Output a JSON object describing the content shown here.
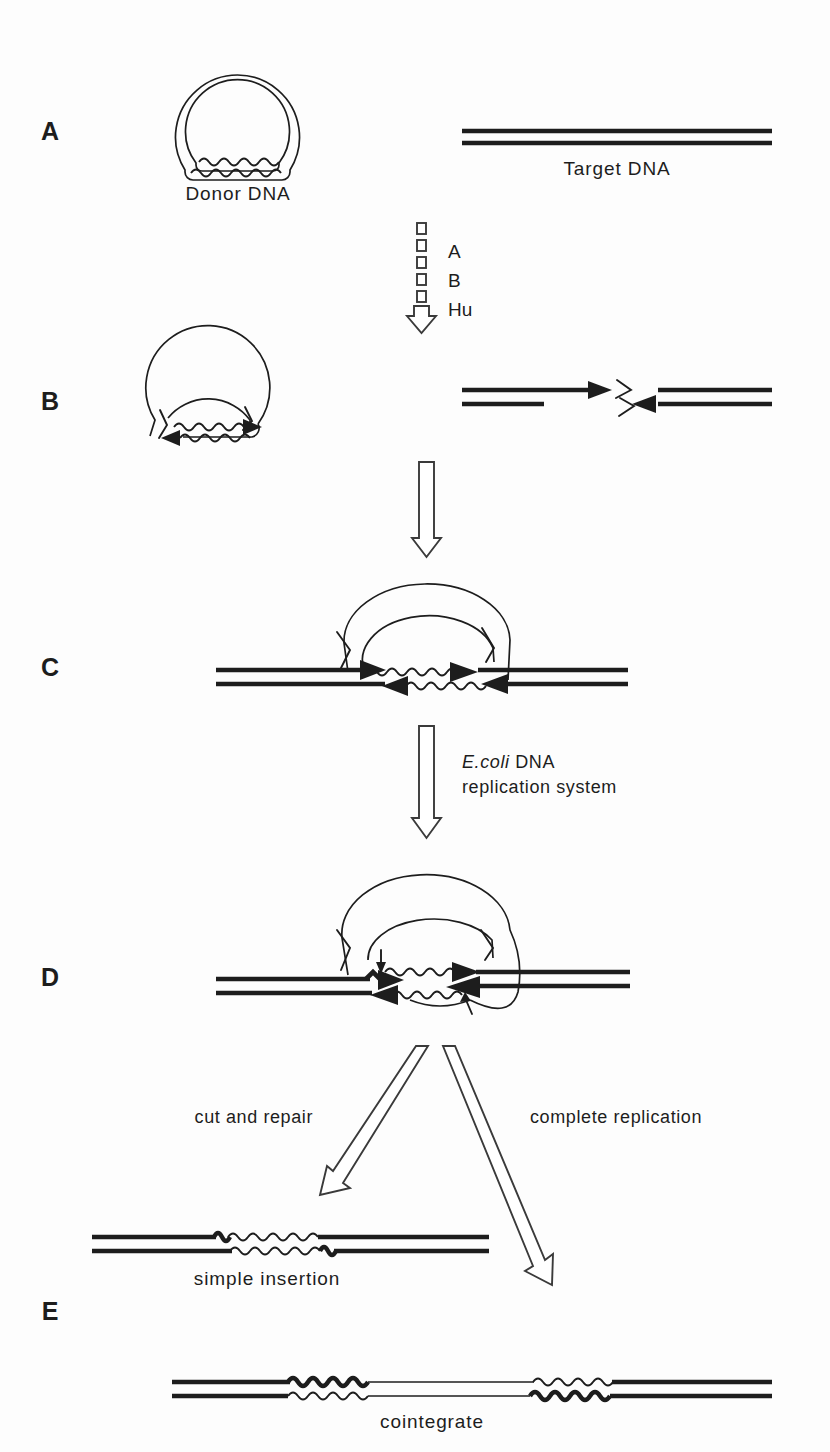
{
  "figure": {
    "background_color": "#fdfdfd",
    "ink_color": "#1d1d1d",
    "width": 830,
    "height": 1452
  },
  "panels": [
    {
      "id": "A",
      "letter": "A",
      "x": 50,
      "y": 140
    },
    {
      "id": "B",
      "letter": "B",
      "x": 50,
      "y": 410
    },
    {
      "id": "C",
      "letter": "C",
      "x": 50,
      "y": 676
    },
    {
      "id": "D",
      "letter": "D",
      "x": 50,
      "y": 986
    },
    {
      "id": "E",
      "letter": "E",
      "x": 50,
      "y": 1320
    }
  ],
  "captions": {
    "donor_dna": "Donor DNA",
    "target_dna": "Target DNA",
    "simple_insertion": "simple insertion",
    "cointegrate": "cointegrate"
  },
  "steps": {
    "factors": [
      "A",
      "B",
      "Hu"
    ],
    "strand_transfer_arrow": "",
    "replication": {
      "line1_italic": "E.coli",
      "line1_rest": " DNA",
      "line2": "replication system"
    },
    "branch_left": "cut and repair",
    "branch_right": "complete replication"
  },
  "legend_notes": {
    "thick_line_meaning": "target DNA duplex",
    "wavy_line_meaning": "transposon (donor) element",
    "solid_arrowhead_meaning": "3-prime strand end",
    "small_arrow_meaning": "replication fork direction"
  }
}
